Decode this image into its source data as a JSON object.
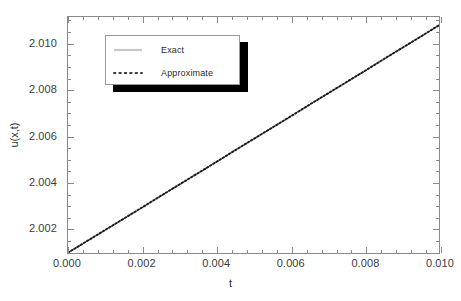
{
  "chart_data": {
    "type": "line",
    "title": "",
    "xlabel": "t",
    "ylabel": "u(x,t)",
    "xlim": [
      0.0,
      0.01
    ],
    "ylim": [
      2.0009,
      2.01115
    ],
    "grid": false,
    "legend_position": "upper-left-inset",
    "xticks": [
      "0.000",
      "0.002",
      "0.004",
      "0.006",
      "0.008",
      "0.010"
    ],
    "xtick_values": [
      0.0,
      0.002,
      0.004,
      0.006,
      0.008,
      0.01
    ],
    "yticks": [
      "2.002",
      "2.004",
      "2.006",
      "2.008",
      "2.010"
    ],
    "ytick_values": [
      2.002,
      2.004,
      2.006,
      2.008,
      2.01
    ],
    "x": [
      0.0,
      0.0005,
      0.001,
      0.0015,
      0.002,
      0.0025,
      0.003,
      0.0035,
      0.004,
      0.0045,
      0.005,
      0.0055,
      0.006,
      0.0065,
      0.007,
      0.0075,
      0.008,
      0.0085,
      0.009,
      0.0095,
      0.01
    ],
    "series": [
      {
        "name": "Exact",
        "style": "solid",
        "color": "#c8c8c8",
        "values": [
          2.001,
          2.00149,
          2.00198,
          2.00247,
          2.00296,
          2.00346,
          2.00395,
          2.00444,
          2.00493,
          2.00543,
          2.00592,
          2.00641,
          2.0069,
          2.0074,
          2.00789,
          2.00838,
          2.00887,
          2.00937,
          2.00986,
          2.01035,
          2.01085
        ]
      },
      {
        "name": "Approximate",
        "style": "dotted",
        "color": "#1a1a1a",
        "values": [
          2.001,
          2.00149,
          2.00198,
          2.00247,
          2.00296,
          2.00346,
          2.00395,
          2.00444,
          2.00493,
          2.00543,
          2.00592,
          2.00641,
          2.0069,
          2.0074,
          2.00789,
          2.00838,
          2.00887,
          2.00937,
          2.00986,
          2.01035,
          2.01085
        ]
      }
    ]
  },
  "axes": {
    "xlabel": "t",
    "ylabel": "u(x,t)",
    "xtick_labels": [
      "0.000",
      "0.002",
      "0.004",
      "0.006",
      "0.008",
      "0.010"
    ],
    "ytick_labels": [
      "2.010",
      "2.008",
      "2.006",
      "2.004",
      "2.002"
    ]
  },
  "legend": {
    "entries": [
      {
        "label": "Exact",
        "style": "solid",
        "color": "#c8c8c8"
      },
      {
        "label": "Approximate",
        "style": "dotted",
        "color": "#1a1a1a"
      }
    ]
  },
  "colors": {
    "background": "#ffffff",
    "frame": "#8a8a8a",
    "tick_label": "#3b3b3b",
    "axis_label": "#2b2b2b",
    "exact_line": "#c8c8c8",
    "approximate_line": "#1a1a1a",
    "legend_shadow": "#000000",
    "legend_border": "#9a9a9a"
  }
}
